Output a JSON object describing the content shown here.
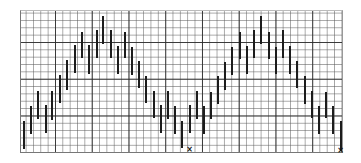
{
  "chart_data": {
    "type": "bar",
    "subtype": "high-low range bars",
    "title": "",
    "xlabel": "",
    "ylabel": "",
    "grid": true,
    "grid_style": "graph paper: minor cells with heavier line every 5 cells",
    "legend": null,
    "ylim": [
      0,
      19.5
    ],
    "xlim": [
      0,
      44
    ],
    "units": "grid cells",
    "x": [
      0.45,
      1.4,
      2.35,
      3.35,
      4.25,
      5.35,
      6.3,
      7.3,
      8.25,
      9.2,
      10.3,
      11.2,
      12.2,
      13.15,
      14.1,
      15.05,
      16.05,
      17.05,
      18.05,
      19.05,
      19.95,
      20.95,
      21.95,
      22.95,
      23.95,
      24.95,
      25.9,
      26.85,
      27.8,
      28.75,
      29.8,
      30.8,
      31.75,
      32.7,
      33.7,
      34.7,
      35.65,
      36.65,
      37.6,
      38.6,
      39.6,
      40.6,
      41.55,
      42.5,
      43.5
    ],
    "series": [
      {
        "name": "high",
        "values": [
          4.5,
          6.5,
          8.6,
          6.7,
          8.6,
          10.7,
          12.8,
          14.8,
          16.6,
          14.8,
          16.9,
          18.8,
          16.9,
          14.7,
          16.6,
          14.6,
          12.7,
          10.6,
          8.6,
          6.7,
          8.6,
          6.5,
          4.5,
          6.7,
          8.6,
          6.5,
          8.4,
          10.6,
          12.5,
          14.6,
          16.6,
          14.7,
          16.9,
          18.8,
          16.6,
          14.6,
          16.9,
          14.7,
          12.7,
          10.6,
          8.6,
          6.5,
          8.4,
          6.5,
          4.5
        ]
      },
      {
        "name": "low",
        "values": [
          0.7,
          2.7,
          4.8,
          2.9,
          4.6,
          6.9,
          8.7,
          11.0,
          13.1,
          10.9,
          13.1,
          15.0,
          13.1,
          10.9,
          13.1,
          10.7,
          9.0,
          6.9,
          4.9,
          2.9,
          4.8,
          2.7,
          0.8,
          2.9,
          4.8,
          2.7,
          4.8,
          6.8,
          8.7,
          10.7,
          12.9,
          10.9,
          13.1,
          15.0,
          12.9,
          10.9,
          13.1,
          10.9,
          9.0,
          6.8,
          4.9,
          2.7,
          4.9,
          2.7,
          0.4
        ]
      }
    ],
    "annotations": [
      {
        "label": "×",
        "x": 22.95,
        "y": 0.5
      },
      {
        "label": "×",
        "x": 43.5,
        "y": 0.4
      }
    ]
  },
  "plot": {
    "cell_px": 7.35,
    "left_px": 20,
    "top_px": 10,
    "width_px": 323,
    "height_px": 143
  }
}
